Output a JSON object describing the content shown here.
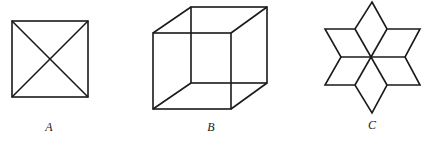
{
  "figures": [
    {
      "id": "A",
      "label": "A",
      "description": "square with both diagonals"
    },
    {
      "id": "B",
      "label": "B",
      "description": "wireframe cube (Necker cube)"
    },
    {
      "id": "C",
      "label": "C",
      "description": "six-pointed star made of rhombi"
    }
  ],
  "colors": {
    "line": "#1a1a1a",
    "background": "#ffffff"
  }
}
